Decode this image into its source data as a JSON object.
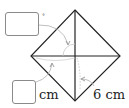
{
  "diagram": {
    "type": "square-with-diagonals",
    "vertices": {
      "top": [
        75,
        10
      ],
      "right": [
        120,
        56
      ],
      "bottom": [
        75,
        101
      ],
      "left": [
        31,
        56
      ]
    },
    "center": [
      75,
      56
    ],
    "colors": {
      "stroke": "#222222",
      "guide": "#b8b8b8",
      "box_border": "#8a8a8a"
    }
  },
  "labels": {
    "angle_box": {
      "value": "",
      "unit": "°"
    },
    "length_box": {
      "value": "",
      "unit": "cm"
    },
    "side_length": "6 cm"
  }
}
